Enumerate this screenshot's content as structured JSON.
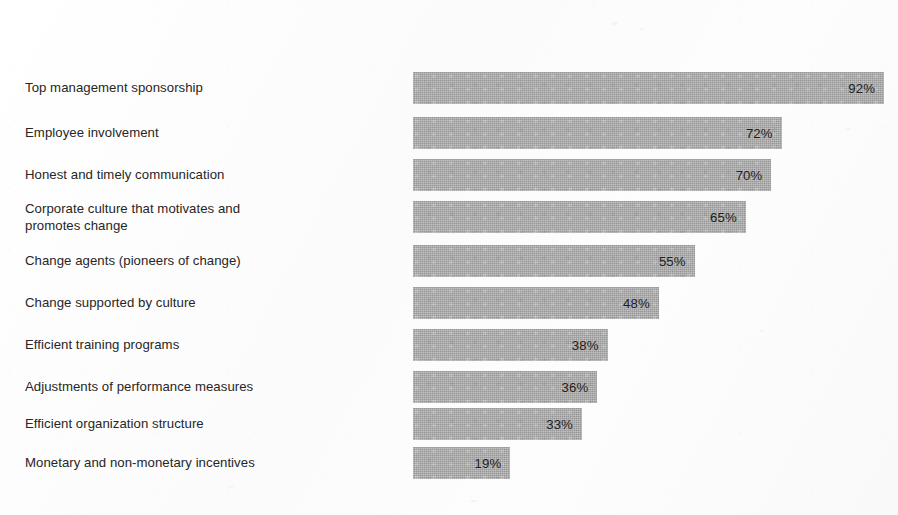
{
  "chart_data": {
    "type": "bar",
    "orientation": "horizontal",
    "title": "",
    "subtitle": "",
    "xlabel": "",
    "ylabel": "",
    "xlim": [
      0,
      100
    ],
    "grid": false,
    "legend": null,
    "value_suffix": "%",
    "bar_color": "#a9a9a9",
    "background_color": "#fdfdfd",
    "text_color": "#262626",
    "categories": [
      "Top management sponsorship",
      "Employee involvement",
      "Honest and timely communication",
      "Corporate culture that motivates and\npromotes change",
      "Change agents (pioneers of change)",
      "Change supported by culture",
      "Efficient training programs",
      "Adjustments of performance measures",
      "Efficient organization structure",
      "Monetary and non-monetary incentives"
    ],
    "values": [
      92,
      72,
      70,
      65,
      55,
      48,
      38,
      36,
      33,
      19
    ],
    "value_labels": [
      "92%",
      "72%",
      "70%",
      "65%",
      "55%",
      "48%",
      "38%",
      "36%",
      "33%",
      "19%"
    ]
  },
  "rows": [
    {
      "label": "Top management sponsorship",
      "value": 92,
      "value_label": "92%",
      "top": 72,
      "lines": 1
    },
    {
      "label": "Employee involvement",
      "value": 72,
      "value_label": "72%",
      "top": 117,
      "lines": 1
    },
    {
      "label": "Honest and timely communication",
      "value": 70,
      "value_label": "70%",
      "top": 159,
      "lines": 1
    },
    {
      "label": "Corporate culture that motivates and\npromotes change",
      "value": 65,
      "value_label": "65%",
      "top": 201,
      "lines": 2
    },
    {
      "label": "Change agents (pioneers of change)",
      "value": 55,
      "value_label": "55%",
      "top": 245,
      "lines": 1
    },
    {
      "label": "Change supported by culture",
      "value": 48,
      "value_label": "48%",
      "top": 287,
      "lines": 1
    },
    {
      "label": "Efficient training programs",
      "value": 38,
      "value_label": "38%",
      "top": 329,
      "lines": 1
    },
    {
      "label": "Adjustments of performance measures",
      "value": 36,
      "value_label": "36%",
      "top": 371,
      "lines": 1
    },
    {
      "label": "Efficient organization structure",
      "value": 33,
      "value_label": "33%",
      "top": 408,
      "lines": 1
    },
    {
      "label": "Monetary and non-monetary incentives",
      "value": 19,
      "value_label": "19%",
      "top": 447,
      "lines": 1
    }
  ],
  "scale": {
    "bar_origin_x": 413,
    "px_per_percent": 5.12,
    "bar_height": 32
  }
}
